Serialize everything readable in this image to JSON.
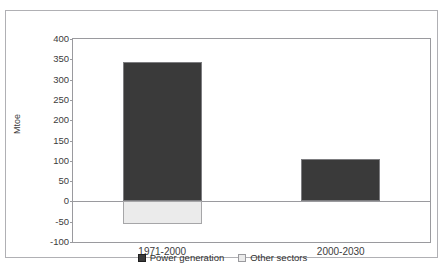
{
  "chart_data": {
    "type": "bar",
    "title": "",
    "xlabel": "",
    "ylabel": "Mtoe",
    "categories": [
      "1971-2000",
      "2000-2030"
    ],
    "series": [
      {
        "name": "Power generation",
        "values": [
          343,
          105
        ],
        "color": "#3a3a3a"
      },
      {
        "name": "Other sectors",
        "values": [
          -55,
          0
        ],
        "color": "#ebebeb"
      }
    ],
    "stacked": true,
    "ylim": [
      -100,
      400
    ],
    "yticks": [
      400,
      350,
      300,
      250,
      200,
      150,
      100,
      50,
      0,
      -50,
      -100
    ],
    "ytick_labels": [
      "400",
      "350",
      "300",
      "250",
      "200",
      "150",
      "100",
      "50",
      "0",
      "-50",
      "-100"
    ],
    "grid": false,
    "legend_position": "bottom"
  },
  "legend": {
    "items": [
      {
        "label": "Power generation",
        "color": "#3a3a3a",
        "border": "#1f1f1f"
      },
      {
        "label": "Other sectors",
        "color": "#ebebeb",
        "border": "#9a9a9e"
      }
    ]
  }
}
